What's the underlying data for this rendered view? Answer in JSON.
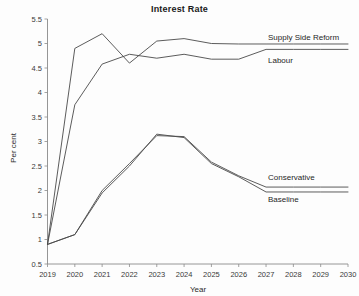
{
  "chart_data": {
    "type": "line",
    "title": "Interest Rate",
    "xlabel": "Year",
    "ylabel": "Per cent",
    "grid": false,
    "legend_position": "right-inline-labels",
    "x": [
      2019,
      2020,
      2021,
      2022,
      2023,
      2024,
      2025,
      2026,
      2027,
      2028,
      2029,
      2030
    ],
    "xlim": [
      2019,
      2030
    ],
    "ylim": [
      0.5,
      5.5
    ],
    "yticks": [
      0.5,
      1,
      1.5,
      2,
      2.5,
      3,
      3.5,
      4,
      4.5,
      5,
      5.5
    ],
    "ytick_labels": [
      "0.5",
      "1",
      "1.5",
      "2",
      "2.5",
      "3",
      "3.5",
      "4",
      "4.5",
      "5",
      "5.5"
    ],
    "xtick_labels": [
      "2019",
      "2020",
      "2021",
      "2022",
      "2023",
      "2024",
      "2025",
      "2026",
      "2027",
      "2028",
      "2029",
      "2030"
    ],
    "series": [
      {
        "name": "Supply Side Reform",
        "label": "Supply Side Reform",
        "color": "#4a4a4a",
        "values": [
          0.9,
          4.9,
          5.2,
          4.6,
          5.05,
          5.1,
          5.0,
          4.99,
          4.99,
          4.99,
          4.99,
          4.99
        ]
      },
      {
        "name": "Labour",
        "label": "Labour",
        "color": "#4a4a4a",
        "values": [
          0.9,
          3.75,
          4.58,
          4.78,
          4.7,
          4.78,
          4.68,
          4.68,
          4.88,
          4.88,
          4.88,
          4.88
        ]
      },
      {
        "name": "Conservative",
        "label": "Conservative",
        "color": "#4a4a4a",
        "values": [
          0.9,
          1.1,
          2.0,
          2.55,
          3.12,
          3.1,
          2.58,
          2.3,
          2.07,
          2.07,
          2.07,
          2.07
        ]
      },
      {
        "name": "Baseline",
        "label": "Baseline",
        "color": "#4a4a4a",
        "values": [
          0.9,
          1.1,
          1.95,
          2.5,
          3.15,
          3.08,
          2.55,
          2.28,
          1.97,
          1.97,
          1.97,
          1.97
        ]
      }
    ]
  }
}
